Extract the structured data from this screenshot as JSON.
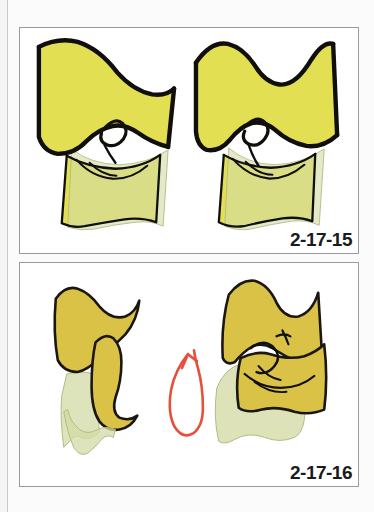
{
  "page": {
    "background_color": "#fbfbfb",
    "binding_line_color": "#c9c9c9",
    "panel_border_color": "#9a9a9a",
    "panel_background": "#ffffff"
  },
  "palette": {
    "bright_yellow": "#e2df52",
    "gold_yellow": "#d9c245",
    "pale_green": "#d4dba6",
    "ink_black": "#100f0c",
    "arrow_red": "#e5503a"
  },
  "figures": [
    {
      "id": "figure-top",
      "label": "2-17-15",
      "fill_color": "#e2df52",
      "overlay_color": "#d4dba6",
      "outline_color": "#100f0c",
      "has_arrow": false,
      "panels": [
        {
          "name": "left-specimen",
          "description": "Hand-drawn bowtie shaped upper element seated over a lower trapezoid element with pale green translucent overlay"
        },
        {
          "name": "right-specimen",
          "description": "Mirror view of the same articulated pair seen from a slightly rotated angle"
        }
      ]
    },
    {
      "id": "figure-bottom",
      "label": "2-17-16",
      "fill_color": "#d9c245",
      "overlay_color": "#d4dba6",
      "outline_color": "#100f0c",
      "has_arrow": true,
      "arrow_color": "#e5503a",
      "arrow_description": "red-orange looping curved arrow pointing up and to the right, indicating rotation from the left specimen to the right specimen",
      "panels": [
        {
          "name": "left-specimen",
          "description": "Disarticulated / separated pair of gold elements with pale green element behind"
        },
        {
          "name": "right-specimen",
          "description": "Re-articulated pair of gold elements overlapping a pale green element"
        }
      ]
    }
  ]
}
